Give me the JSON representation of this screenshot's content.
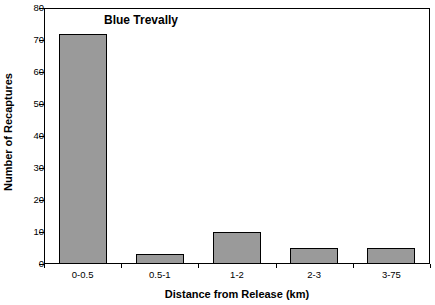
{
  "chart_data": {
    "type": "bar",
    "title": "Blue Trevally",
    "xlabel": "Distance from Release (km)",
    "ylabel": "Number of Recaptures",
    "categories": [
      "0-0.5",
      "0.5-1",
      "1-2",
      "2-3",
      "3-75"
    ],
    "values": [
      72,
      3,
      10,
      5,
      5
    ],
    "ylim": [
      0,
      80
    ],
    "yticks": [
      0,
      10,
      20,
      30,
      40,
      50,
      60,
      70,
      80
    ],
    "ytick_labels": [
      "0",
      "10",
      "20",
      "30",
      "40",
      "50",
      "60",
      "70",
      "80"
    ],
    "grid": false,
    "legend": null,
    "bar_color": "#9a9a9a",
    "bar_edge_color": "#000000",
    "axis_color": "#000000",
    "background_color": "#ffffff"
  }
}
